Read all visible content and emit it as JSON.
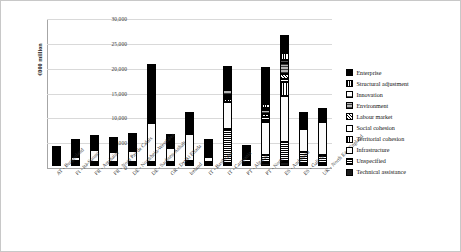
{
  "chart_data": {
    "type": "bar",
    "stacked": true,
    "title": "",
    "xlabel": "",
    "ylabel": "€000 million",
    "ylim": [
      0,
      30000
    ],
    "ytick_labels": [
      "0",
      "5,000",
      "10,000",
      "15,000",
      "20,000",
      "25,000",
      "30,000"
    ],
    "ytick_values": [
      0,
      5000,
      10000,
      15000,
      20000,
      25000,
      30000
    ],
    "grid": true,
    "legend_position": "right",
    "categories": [
      "AT - Burgenland",
      "FI - Itä-Suomi",
      "FR - Aquitaine",
      "FR - Nord Pas de Calais",
      "DE - Nordrhein-Westfalen",
      "DE - Sachsen-Anhalt",
      "GR - Dytiki Ellada",
      "Ireland",
      "IT - Basilicata",
      "IT - Campania",
      "PT - Algarve",
      "PT - Norte",
      "ES - Andalucía",
      "ES - Galicia",
      "UK - North East England"
    ],
    "series": [
      {
        "name": "Enterprise",
        "pattern": "p-enterprise",
        "values": [
          290,
          1250,
          700,
          620,
          1250,
          9300,
          400,
          2050,
          1300,
          4000,
          550,
          7600,
          3500,
          900,
          500
        ]
      },
      {
        "name": "Structural adjustment",
        "pattern": "p-structural",
        "values": [
          60,
          350,
          140,
          160,
          280,
          350,
          120,
          260,
          200,
          500,
          100,
          700,
          1400,
          250,
          120
        ]
      },
      {
        "name": "Innovation",
        "pattern": "p-innovation",
        "values": [
          50,
          160,
          120,
          150,
          180,
          120,
          110,
          180,
          150,
          300,
          70,
          400,
          600,
          200,
          100
        ]
      },
      {
        "name": "Environment",
        "pattern": "p-environment",
        "values": [
          70,
          220,
          190,
          260,
          240,
          300,
          180,
          380,
          260,
          900,
          120,
          900,
          2300,
          400,
          180
        ]
      },
      {
        "name": "Labour market",
        "pattern": "p-labour",
        "values": [
          60,
          280,
          160,
          300,
          320,
          200,
          140,
          320,
          220,
          500,
          90,
          600,
          900,
          300,
          140
        ]
      },
      {
        "name": "Social cohesion",
        "pattern": "p-social",
        "values": [
          40,
          150,
          110,
          180,
          200,
          150,
          100,
          200,
          180,
          350,
          60,
          450,
          700,
          180,
          90
        ]
      },
      {
        "name": "Territorial cohesion",
        "pattern": "p-territorial",
        "values": [
          70,
          330,
          260,
          420,
          420,
          180,
          210,
          360,
          330,
          650,
          110,
          550,
          2700,
          500,
          200
        ]
      },
      {
        "name": "Infrastructure",
        "pattern": "p-infrastructure",
        "values": [
          170,
          850,
          2400,
          1950,
          2100,
          7900,
          2900,
          5400,
          1000,
          5300,
          550,
          6500,
          9400,
          4600,
          6700
        ]
      },
      {
        "name": "Unspecified",
        "pattern": "p-unspecified",
        "values": [
          80,
          600,
          360,
          300,
          440,
          450,
          250,
          700,
          280,
          7100,
          200,
          1700,
          4000,
          2400,
          1750
        ]
      },
      {
        "name": "Technical assistance",
        "pattern": "p-technical",
        "values": [
          40,
          110,
          60,
          60,
          70,
          50,
          40,
          100,
          80,
          400,
          50,
          600,
          800,
          170,
          80
        ]
      }
    ],
    "totals": [
      930,
      4300,
      4500,
      4400,
      5500,
      19000,
      4450,
      9950,
      4000,
      20000,
      1900,
      20000,
      26300,
      9900,
      9860
    ]
  }
}
